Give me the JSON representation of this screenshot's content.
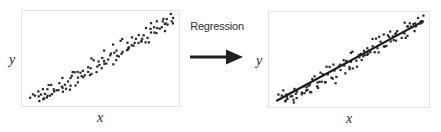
{
  "figure": {
    "title": "",
    "background_color": "#ffffff",
    "frame_color": "#e3e3e3",
    "point_color": "#262626",
    "line_color": "#1a1a1a"
  },
  "transition": {
    "caption": "Regression",
    "arrow_icon": "right-arrow-icon"
  },
  "chart_data": [
    {
      "type": "scatter",
      "id": "left-scatter",
      "title": "",
      "xlabel": "x",
      "ylabel": "y",
      "xlim": [
        0,
        100
      ],
      "ylim": [
        0,
        100
      ],
      "grid": false,
      "legend": null,
      "fit_line": null,
      "point_color": "#262626",
      "x": [
        3.0,
        4.5,
        5.2,
        6.8,
        7.4,
        8.1,
        9.0,
        9.6,
        10.4,
        11.2,
        11.9,
        12.6,
        13.3,
        14.1,
        14.8,
        15.6,
        16.4,
        17.2,
        18.0,
        18.9,
        19.7,
        20.5,
        21.3,
        22.1,
        23.0,
        23.8,
        24.6,
        25.4,
        26.2,
        27.1,
        27.9,
        28.7,
        29.5,
        30.4,
        31.2,
        32.0,
        32.8,
        33.7,
        34.5,
        35.3,
        36.1,
        37.0,
        37.8,
        38.6,
        39.4,
        40.3,
        41.1,
        41.9,
        42.7,
        43.6,
        44.4,
        45.2,
        46.0,
        46.9,
        47.7,
        48.5,
        49.3,
        50.2,
        51.0,
        51.8,
        52.6,
        53.5,
        54.3,
        55.1,
        55.9,
        56.8,
        57.6,
        58.4,
        59.2,
        60.1,
        60.9,
        61.7,
        62.5,
        63.4,
        64.2,
        65.0,
        65.8,
        66.7,
        67.5,
        68.3,
        69.1,
        70.0,
        70.8,
        71.6,
        72.4,
        73.3,
        74.1,
        74.9,
        75.7,
        76.6,
        77.4,
        78.2,
        79.0,
        79.9,
        80.7,
        81.5,
        82.3,
        83.2,
        84.0,
        84.8,
        85.6,
        86.5,
        87.3,
        88.1,
        88.9,
        89.8,
        90.6,
        91.4,
        92.2,
        93.1,
        93.9,
        94.7,
        95.5,
        96.4,
        97.2,
        98.0,
        98.8
      ],
      "y": [
        9.0,
        5.5,
        12.0,
        7.5,
        4.0,
        10.5,
        13.5,
        6.0,
        9.5,
        15.0,
        11.0,
        5.0,
        8.5,
        16.5,
        12.5,
        7.0,
        18.0,
        14.0,
        10.0,
        20.5,
        16.0,
        12.0,
        22.0,
        18.5,
        15.5,
        24.5,
        20.0,
        17.0,
        26.0,
        21.5,
        30.5,
        23.0,
        19.5,
        33.0,
        26.5,
        22.5,
        35.5,
        28.0,
        24.5,
        38.0,
        31.0,
        27.0,
        41.5,
        33.5,
        29.0,
        44.0,
        36.0,
        31.5,
        46.5,
        39.0,
        34.0,
        49.5,
        41.0,
        36.5,
        52.0,
        44.5,
        39.5,
        55.0,
        47.0,
        42.0,
        57.5,
        50.0,
        45.0,
        60.0,
        52.5,
        48.0,
        62.5,
        55.5,
        50.5,
        65.0,
        58.0,
        53.0,
        67.0,
        60.5,
        56.0,
        70.0,
        63.0,
        58.5,
        72.5,
        66.0,
        61.0,
        75.0,
        68.0,
        64.0,
        77.5,
        71.0,
        66.5,
        80.0,
        73.5,
        69.0,
        82.5,
        76.0,
        72.0,
        85.0,
        78.5,
        74.5,
        87.5,
        81.0,
        77.0,
        90.0,
        84.0,
        79.5,
        92.0,
        86.5,
        82.0,
        94.0,
        89.0,
        85.0,
        96.5,
        91.0,
        87.5,
        98.0,
        93.0,
        90.0,
        99.0,
        95.0,
        97.0
      ]
    },
    {
      "type": "scatter",
      "id": "right-scatter",
      "title": "",
      "xlabel": "x",
      "ylabel": "y",
      "xlim": [
        0,
        100
      ],
      "ylim": [
        0,
        100
      ],
      "grid": false,
      "legend": null,
      "point_color": "#262626",
      "fit_line": {
        "label": "regression-line",
        "color": "#1a1a1a",
        "width": 2.2,
        "x_start": 2.0,
        "y_start": 4.0,
        "x_end": 98.0,
        "y_end": 95.0,
        "slope": 0.948,
        "intercept": 2.1
      },
      "x": [
        3.0,
        4.5,
        5.2,
        6.8,
        7.4,
        8.1,
        9.0,
        9.6,
        10.4,
        11.2,
        11.9,
        12.6,
        13.3,
        14.1,
        14.8,
        15.6,
        16.4,
        17.2,
        18.0,
        18.9,
        19.7,
        20.5,
        21.3,
        22.1,
        23.0,
        23.8,
        24.6,
        25.4,
        26.2,
        27.1,
        27.9,
        28.7,
        29.5,
        30.4,
        31.2,
        32.0,
        32.8,
        33.7,
        34.5,
        35.3,
        36.1,
        37.0,
        37.8,
        38.6,
        39.4,
        40.3,
        41.1,
        41.9,
        42.7,
        43.6,
        44.4,
        45.2,
        46.0,
        46.9,
        47.7,
        48.5,
        49.3,
        50.2,
        51.0,
        51.8,
        52.6,
        53.5,
        54.3,
        55.1,
        55.9,
        56.8,
        57.6,
        58.4,
        59.2,
        60.1,
        60.9,
        61.7,
        62.5,
        63.4,
        64.2,
        65.0,
        65.8,
        66.7,
        67.5,
        68.3,
        69.1,
        70.0,
        70.8,
        71.6,
        72.4,
        73.3,
        74.1,
        74.9,
        75.7,
        76.6,
        77.4,
        78.2,
        79.0,
        79.9,
        80.7,
        81.5,
        82.3,
        83.2,
        84.0,
        84.8,
        85.6,
        86.5,
        87.3,
        88.1,
        88.9,
        89.8,
        90.6,
        91.4,
        92.2,
        93.1,
        93.9,
        94.7,
        95.5,
        96.4,
        97.2,
        98.0,
        98.8
      ],
      "y": [
        9.0,
        5.5,
        12.0,
        7.5,
        4.0,
        10.5,
        13.5,
        6.0,
        9.5,
        15.0,
        11.0,
        5.0,
        8.5,
        16.5,
        12.5,
        7.0,
        18.0,
        14.0,
        10.0,
        20.5,
        16.0,
        12.0,
        22.0,
        18.5,
        15.5,
        24.5,
        20.0,
        17.0,
        26.0,
        21.5,
        30.5,
        23.0,
        19.5,
        33.0,
        26.5,
        22.5,
        35.5,
        28.0,
        24.5,
        38.0,
        31.0,
        27.0,
        41.5,
        33.5,
        29.0,
        44.0,
        36.0,
        31.5,
        46.5,
        39.0,
        34.0,
        49.5,
        41.0,
        36.5,
        52.0,
        44.5,
        39.5,
        55.0,
        47.0,
        42.0,
        57.5,
        50.0,
        45.0,
        60.0,
        52.5,
        48.0,
        62.5,
        55.5,
        50.5,
        65.0,
        58.0,
        53.0,
        67.0,
        60.5,
        56.0,
        70.0,
        63.0,
        58.5,
        72.5,
        66.0,
        61.0,
        75.0,
        68.0,
        64.0,
        77.5,
        71.0,
        66.5,
        80.0,
        73.5,
        69.0,
        82.5,
        76.0,
        72.0,
        85.0,
        78.5,
        74.5,
        87.5,
        81.0,
        77.0,
        90.0,
        84.0,
        79.5,
        92.0,
        86.5,
        82.0,
        94.0,
        89.0,
        85.0,
        96.5,
        91.0,
        87.5,
        98.0,
        93.0,
        90.0,
        99.0,
        95.0,
        97.0
      ]
    }
  ]
}
